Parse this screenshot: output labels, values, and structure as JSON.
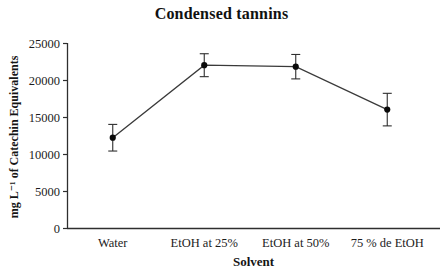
{
  "chart_data": {
    "type": "line",
    "title": "Condensed tannins",
    "xlabel": "Solvent",
    "ylabel": "mg L⁻¹ of Catechin Equivalents",
    "categories": [
      "Water",
      "EtOH at 25%",
      "EtOH at 50%",
      "75 % de EtOH"
    ],
    "series": [
      {
        "name": "Condensed tannins",
        "values": [
          12200,
          22000,
          21800,
          16000
        ],
        "error_bars": [
          1800,
          1550,
          1650,
          2200
        ]
      }
    ],
    "ylim": [
      0,
      25000
    ],
    "yticks": [
      0,
      5000,
      10000,
      15000,
      20000,
      25000
    ],
    "grid": false,
    "legend": "none",
    "marker": "filled-circle",
    "colors": {
      "axis": "#2e2e2e",
      "line": "#3a3a3a",
      "marker": "#0a0a0a",
      "text": "#1c1c1c",
      "background": "#ffffff"
    }
  }
}
